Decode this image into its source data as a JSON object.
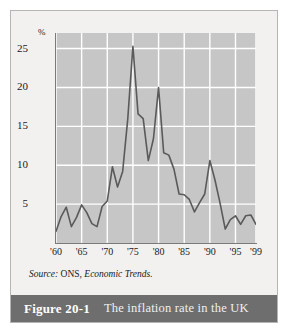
{
  "figure": {
    "number_label": "Figure 20-1",
    "title": "The inflation rate in the UK",
    "source_prefix": "Source:",
    "source_body": "ONS,",
    "source_publication": "Economic Trends."
  },
  "colors": {
    "plot_background": "#c6c6c6",
    "gridline": "#ffffff",
    "line": "#5a5a5a",
    "axis": "#7a7a7a",
    "caption_bar": "#6e6e6e",
    "page_background": "#f2f1ef"
  },
  "chart_data": {
    "type": "line",
    "title": "The inflation rate in the UK",
    "xlabel": "",
    "ylabel": "%",
    "y_unit_label": "%",
    "xlim": [
      1960,
      1999
    ],
    "ylim": [
      0,
      27
    ],
    "yticks": [
      5,
      10,
      15,
      20,
      25
    ],
    "ytick_labels": [
      "5",
      "10",
      "15",
      "20",
      "25"
    ],
    "xticks": [
      1960,
      1965,
      1970,
      1975,
      1980,
      1985,
      1990,
      1995,
      1999
    ],
    "xtick_labels": [
      "'60",
      "'65",
      "'70",
      "'75",
      "'80",
      "'85",
      "'90",
      "'95",
      "'99"
    ],
    "grid": true,
    "legend": "none",
    "series": [
      {
        "name": "UK inflation rate",
        "x": [
          1960,
          1961,
          1962,
          1963,
          1964,
          1965,
          1966,
          1967,
          1968,
          1969,
          1970,
          1971,
          1972,
          1973,
          1974,
          1975,
          1976,
          1977,
          1978,
          1979,
          1980,
          1981,
          1982,
          1983,
          1984,
          1985,
          1986,
          1987,
          1988,
          1989,
          1990,
          1991,
          1992,
          1993,
          1994,
          1995,
          1996,
          1997,
          1998,
          1999
        ],
        "values": [
          1.5,
          3.4,
          4.6,
          2.1,
          3.3,
          4.9,
          3.9,
          2.5,
          2.1,
          4.7,
          5.4,
          9.8,
          7.2,
          9.2,
          16.0,
          25.3,
          16.6,
          16.0,
          10.6,
          13.4,
          20.0,
          11.6,
          11.3,
          9.5,
          6.3,
          6.2,
          5.6,
          4.0,
          5.2,
          6.3,
          10.6,
          8.1,
          5.1,
          1.8,
          3.0,
          3.5,
          2.4,
          3.5,
          3.6,
          2.4
        ]
      }
    ]
  }
}
